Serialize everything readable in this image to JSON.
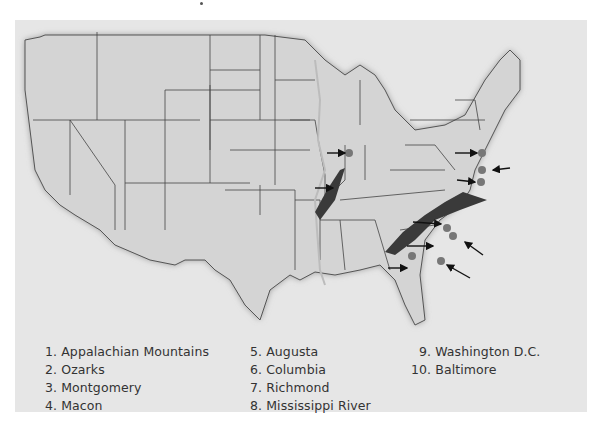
{
  "map": {
    "title": "",
    "region": "Contiguous United States",
    "colors": {
      "background": "#e6e6e6",
      "land": "#d4d4d4",
      "borders": "#444444",
      "mountains": "#3a3a3a",
      "city_marker": "#777777",
      "arrows": "#111111"
    },
    "features": [
      {
        "id": 1,
        "name": "Appalachian Mountains",
        "type": "mountain-range"
      },
      {
        "id": 2,
        "name": "Ozarks",
        "type": "mountain-range"
      },
      {
        "id": 3,
        "name": "Montgomery",
        "type": "city"
      },
      {
        "id": 4,
        "name": "Macon",
        "type": "city"
      },
      {
        "id": 5,
        "name": "Augusta",
        "type": "city"
      },
      {
        "id": 6,
        "name": "Columbia",
        "type": "city"
      },
      {
        "id": 7,
        "name": "Richmond",
        "type": "city"
      },
      {
        "id": 8,
        "name": "Mississippi River",
        "type": "river"
      },
      {
        "id": 9,
        "name": "Washington D.C.",
        "type": "city"
      },
      {
        "id": 10,
        "name": "Baltimore",
        "type": "city"
      }
    ]
  },
  "legend": {
    "items": [
      "1. Appalachian Mountains",
      "2. Ozarks",
      "3. Montgomery",
      "4. Macon",
      "5. Augusta",
      "6. Columbia",
      "7. Richmond",
      "8. Mississippi River",
      "9. Washington D.C.",
      "10. Baltimore"
    ]
  }
}
